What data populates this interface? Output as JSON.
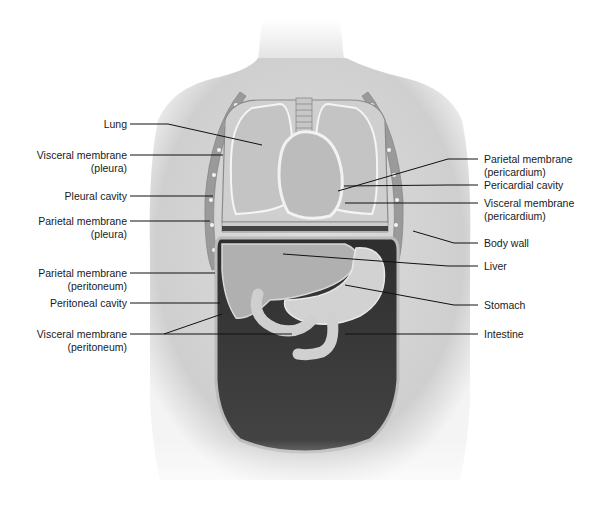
{
  "figure": {
    "labels_left": [
      {
        "id": "lung",
        "lines": [
          "Lung"
        ]
      },
      {
        "id": "visceral-pleura",
        "lines": [
          "Visceral membrane",
          "(pleura)"
        ]
      },
      {
        "id": "pleural-cavity",
        "lines": [
          "Pleural cavity"
        ]
      },
      {
        "id": "parietal-pleura",
        "lines": [
          "Parietal membrane",
          "(pleura)"
        ]
      },
      {
        "id": "parietal-peritoneum",
        "lines": [
          "Parietal membrane",
          "(peritoneum)"
        ]
      },
      {
        "id": "peritoneal-cavity",
        "lines": [
          "Peritoneal cavity"
        ]
      },
      {
        "id": "visceral-peritoneum",
        "lines": [
          "Visceral membrane",
          "(peritoneum)"
        ]
      }
    ],
    "labels_right": [
      {
        "id": "parietal-pericardium",
        "lines": [
          "Parietal membrane",
          "(pericardium)"
        ]
      },
      {
        "id": "pericardial-cavity",
        "lines": [
          "Pericardial cavity"
        ]
      },
      {
        "id": "visceral-pericardium",
        "lines": [
          "Visceral membrane",
          "(pericardium)"
        ]
      },
      {
        "id": "body-wall",
        "lines": [
          "Body wall"
        ]
      },
      {
        "id": "liver",
        "lines": [
          "Liver"
        ]
      },
      {
        "id": "stomach",
        "lines": [
          "Stomach"
        ]
      },
      {
        "id": "intestine",
        "lines": [
          "Intestine"
        ]
      }
    ],
    "colors": {
      "background": "#ffffff",
      "skin": "#d9d9d9",
      "organ": "#bdbdbd",
      "cavity_dark": "#3a3a3a",
      "leader_line": "#111111",
      "label_text": "#1a1a1a"
    }
  }
}
